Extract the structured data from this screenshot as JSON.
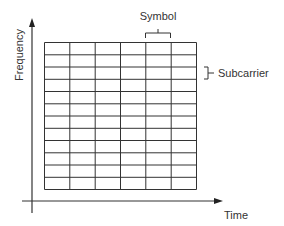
{
  "diagram": {
    "type": "time-frequency resource grid",
    "axes": {
      "x_label": "Time",
      "y_label": "Frequency"
    },
    "grid": {
      "columns": 6,
      "rows": 12
    },
    "annotations": {
      "column_label": "Symbol",
      "row_label": "Subcarrier"
    },
    "colors": {
      "line": "#333333",
      "text": "#333333",
      "background": "#ffffff"
    }
  }
}
